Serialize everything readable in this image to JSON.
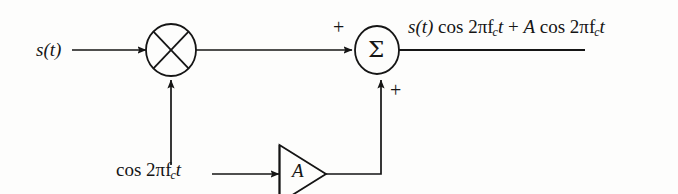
{
  "diagram": {
    "background_color": "#fdfdfc",
    "line_color": "#151515",
    "blocks": {
      "multiplier": {
        "name": "multiplier",
        "symbol": "⊗",
        "cx": 171,
        "cy": 50,
        "rx": 25,
        "ry": 26
      },
      "summer": {
        "name": "summer",
        "symbol": "Σ",
        "cx": 377,
        "cy": 50,
        "rx": 22,
        "ry": 24
      },
      "amplifier": {
        "name": "amplifier",
        "gain_label": "A",
        "x": 279,
        "y": 145,
        "width": 47,
        "height": 58
      }
    },
    "labels": {
      "input_signal": "s(t)",
      "carrier": "cos 2πf",
      "carrier_sub": "c",
      "carrier_tail": "t",
      "amp_gain": "A",
      "plus_top": "+",
      "plus_bottom": "+"
    },
    "output_expression": {
      "full_text": "s(t) cos 2πf_c t + A cos 2πf_c t",
      "part1_signal": "s(t)",
      "part1_cos": "cos 2πf",
      "part1_sub": "c",
      "part1_t": "t",
      "plus": "+",
      "part2_amp": "A",
      "part2_cos": "cos 2πf",
      "part2_sub": "c",
      "part2_t": "t"
    }
  }
}
